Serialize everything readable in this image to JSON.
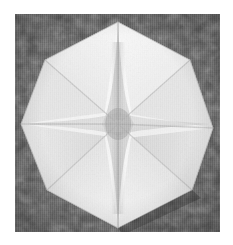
{
  "figure": {
    "title": "Folded paper octagonal star form",
    "medium": "black-and-white photograph",
    "page_background": "#ffffff",
    "plate": {
      "x": 15,
      "y": 14,
      "width": 205,
      "height": 218,
      "border_color": "#2b2b2b",
      "background_color": "#515151",
      "background_description": "mottled dark gray textured cloth backdrop"
    },
    "palette": {
      "page": "#ffffff",
      "backdrop_dark": "#3f3f3f",
      "backdrop_mid": "#565656",
      "backdrop_light": "#676767",
      "paper_highlight": "#f6f6f6",
      "paper_light": "#ededed",
      "paper_mid": "#d8d8d8",
      "paper_shadow": "#bdbdbd",
      "crease_shadow": "#a8a8a8",
      "crease_deep": "#9a9a9a"
    },
    "geometry": {
      "outline_type": "octagon",
      "outline_description": "eight-sided paper disc with sharp top, bottom, left and right apexes",
      "center": {
        "x": 103,
        "y": 110
      },
      "vertices": [
        {
          "name": "top-apex",
          "x": 103,
          "y": 8
        },
        {
          "name": "upper-right",
          "x": 175,
          "y": 46
        },
        {
          "name": "right-apex",
          "x": 198,
          "y": 114
        },
        {
          "name": "lower-right",
          "x": 177,
          "y": 176
        },
        {
          "name": "bottom-apex",
          "x": 103,
          "y": 214
        },
        {
          "name": "lower-left",
          "x": 32,
          "y": 176
        },
        {
          "name": "left-apex",
          "x": 6,
          "y": 110
        },
        {
          "name": "upper-left",
          "x": 30,
          "y": 46
        }
      ],
      "star": {
        "type": "four-pointed-concave-star",
        "points": 4,
        "point_directions": [
          "up",
          "right",
          "down",
          "left"
        ],
        "outer_radius_v": 96,
        "outer_radius_h": 94,
        "waist_radius": 16,
        "shading": "pale gray astroid ridge at the centre of the white facets"
      },
      "facet_count": 16,
      "fold_lines": [
        "center-to-top-apex",
        "center-to-right-apex",
        "center-to-bottom-apex",
        "center-to-left-apex",
        "center-to-upper-left",
        "center-to-upper-right",
        "center-to-lower-right",
        "center-to-lower-left"
      ]
    }
  }
}
